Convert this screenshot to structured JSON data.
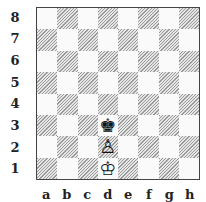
{
  "diagram": {
    "type": "chess-position",
    "ranks": [
      "8",
      "7",
      "6",
      "5",
      "4",
      "3",
      "2",
      "1"
    ],
    "files": [
      "a",
      "b",
      "c",
      "d",
      "e",
      "f",
      "g",
      "h"
    ],
    "pieces": [
      {
        "square": "d3",
        "piece": "king",
        "color": "black",
        "glyph": "♚"
      },
      {
        "square": "d2",
        "piece": "pawn",
        "color": "white",
        "glyph": "♙"
      },
      {
        "square": "d1",
        "piece": "king",
        "color": "white",
        "glyph": "♔"
      }
    ],
    "colors": {
      "light_square": "#fafafa",
      "dark_square_hatch": "#9a9a9a",
      "border": "#444444"
    }
  }
}
